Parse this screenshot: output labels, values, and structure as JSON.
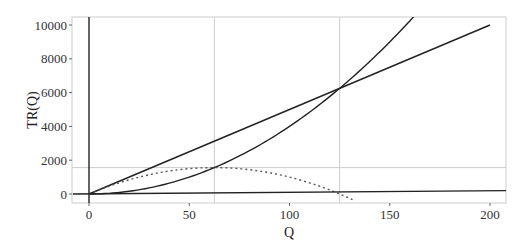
{
  "chart_data": {
    "type": "line",
    "title": "",
    "xlabel": "Q",
    "ylabel": "TR(Q)",
    "xlim": [
      -8,
      208
    ],
    "ylim": [
      -600,
      10400
    ],
    "x_ticks": [
      "0",
      "50",
      "100",
      "150",
      "200"
    ],
    "y_ticks": [
      "0",
      "2000",
      "4000",
      "6000",
      "8000",
      "10000"
    ],
    "grid": false,
    "reference_lines": {
      "vertical": [
        62.5,
        125
      ],
      "horizontal": [
        1562.5
      ]
    },
    "series": [
      {
        "name": "Total Revenue (linear)",
        "style": "solid",
        "formula": "50*Q",
        "x": [
          0,
          200
        ],
        "y": [
          0,
          10000
        ]
      },
      {
        "name": "Total Cost (quadratic)",
        "style": "solid",
        "formula": "0.4*Q^2",
        "x": [
          0,
          25,
          50,
          75,
          100,
          125,
          150,
          161
        ],
        "y": [
          0,
          250,
          1000,
          2250,
          4000,
          6250,
          9000,
          10368
        ]
      },
      {
        "name": "Profit",
        "style": "dotted",
        "formula": "50*Q - 0.4*Q^2",
        "x": [
          0,
          25,
          50,
          62.5,
          75,
          100,
          125,
          132
        ],
        "y": [
          0,
          1000,
          1500,
          1562.5,
          1500,
          1000,
          0,
          -370
        ]
      },
      {
        "name": "Baseline",
        "style": "solid",
        "x": [
          -8,
          208
        ],
        "y": [
          0,
          200
        ]
      }
    ]
  }
}
